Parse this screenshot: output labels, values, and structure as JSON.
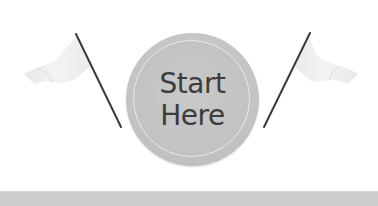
{
  "badge": {
    "line1": "Start",
    "line2": "Here",
    "label": "Start Here"
  },
  "decorations": {
    "left_icon": "flag-icon",
    "right_icon": "flag-icon"
  },
  "colors": {
    "background": "#ffffff",
    "badge_fill": "#c4c4c4",
    "badge_ring": "#e9e9e9",
    "text": "#3c3c3c",
    "pole": "#3a3a3a",
    "flag_cloth": "#ececec",
    "bottom_bar": "#cccccc"
  }
}
